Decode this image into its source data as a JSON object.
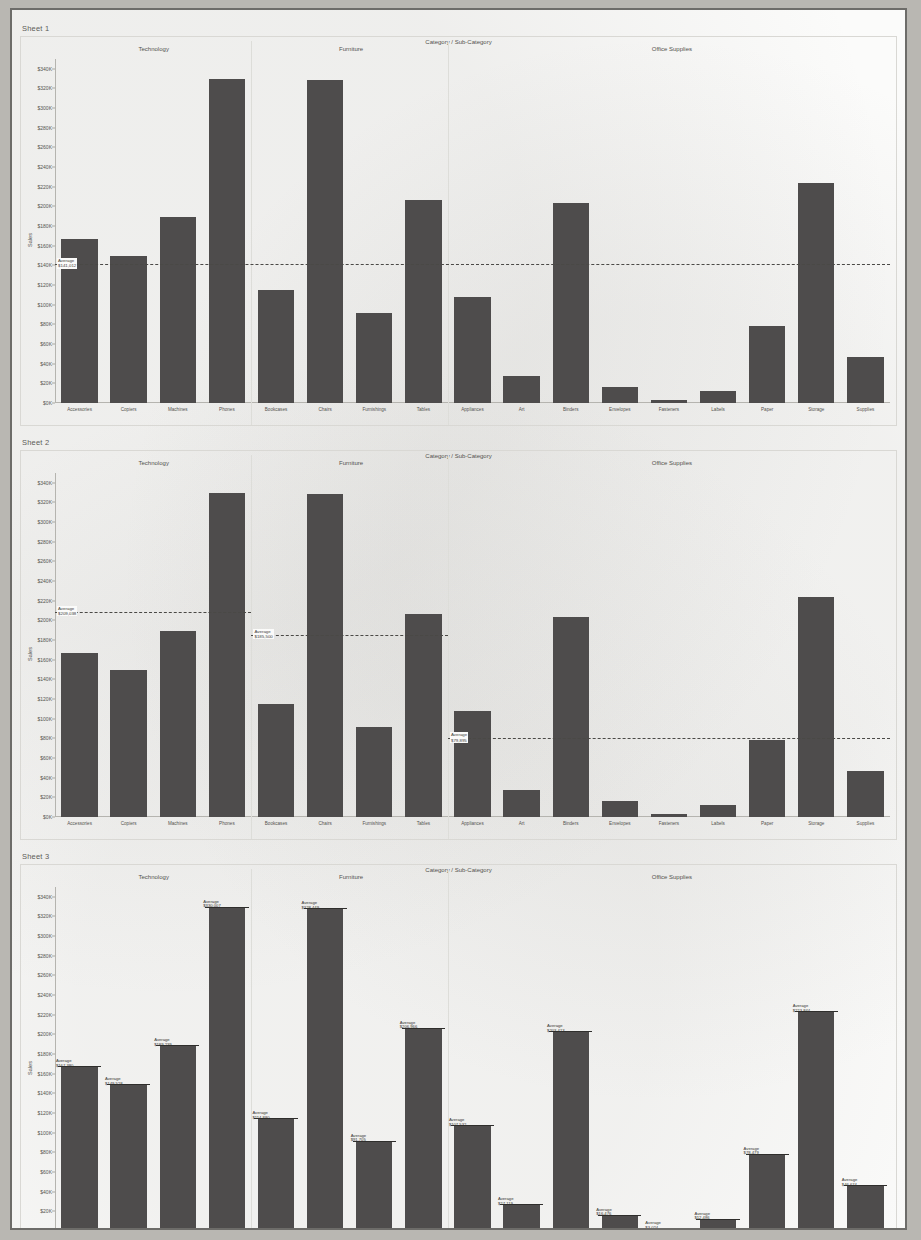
{
  "page": {
    "background_color": "#fbfbfa",
    "border_color": "#6d6c69",
    "bar_color": "#4e4c4c"
  },
  "column_title": "Category / Sub-Category",
  "yaxis_title": "Sales",
  "panes": [
    {
      "label": "Technology"
    },
    {
      "label": "Furniture"
    },
    {
      "label": "Office Supplies"
    }
  ],
  "categories": [
    "Accessories",
    "Copiers",
    "Machines",
    "Phones",
    "Bookcases",
    "Chairs",
    "Furnishings",
    "Tables",
    "Appliances",
    "Art",
    "Binders",
    "Envelopes",
    "Fasteners",
    "Labels",
    "Paper",
    "Storage",
    "Supplies"
  ],
  "pane_spans": [
    4,
    4,
    9
  ],
  "sheets": [
    {
      "title": "Sheet 1",
      "chart_data": {
        "type": "bar",
        "title": "Sheet 1",
        "xlabel": "Category / Sub-Category",
        "ylabel": "Sales",
        "ylim": [
          0,
          350000
        ],
        "grid": false,
        "legend": "none",
        "yticks": [
          "$0K",
          "$20K",
          "$40K",
          "$60K",
          "$80K",
          "$100K",
          "$120K",
          "$140K",
          "$160K",
          "$180K",
          "$200K",
          "$220K",
          "$240K",
          "$260K",
          "$280K",
          "$300K",
          "$320K",
          "$340K"
        ],
        "ytick_values": [
          0,
          20000,
          40000,
          60000,
          80000,
          100000,
          120000,
          140000,
          160000,
          180000,
          200000,
          220000,
          240000,
          260000,
          280000,
          300000,
          320000,
          340000
        ],
        "categories": [
          "Accessories",
          "Copiers",
          "Machines",
          "Phones",
          "Bookcases",
          "Chairs",
          "Furnishings",
          "Tables",
          "Appliances",
          "Art",
          "Binders",
          "Envelopes",
          "Fasteners",
          "Labels",
          "Paper",
          "Storage",
          "Supplies"
        ],
        "values": [
          167380,
          149528,
          189239,
          330007,
          114880,
          328449,
          91705,
          206966,
          107532,
          27119,
          203413,
          16476,
          3024,
          12486,
          78479,
          223844,
          46674
        ],
        "reference_lines": [
          {
            "scope": "table",
            "label": "Average",
            "value_label": "$141,012",
            "value": 141012,
            "from_index": 0,
            "to_index": 16
          }
        ]
      }
    },
    {
      "title": "Sheet 2",
      "chart_data": {
        "type": "bar",
        "title": "Sheet 2",
        "xlabel": "Category / Sub-Category",
        "ylabel": "Sales",
        "ylim": [
          0,
          350000
        ],
        "grid": false,
        "legend": "none",
        "yticks": [
          "$0K",
          "$20K",
          "$40K",
          "$60K",
          "$80K",
          "$100K",
          "$120K",
          "$140K",
          "$160K",
          "$180K",
          "$200K",
          "$220K",
          "$240K",
          "$260K",
          "$280K",
          "$300K",
          "$320K",
          "$340K"
        ],
        "ytick_values": [
          0,
          20000,
          40000,
          60000,
          80000,
          100000,
          120000,
          140000,
          160000,
          180000,
          200000,
          220000,
          240000,
          260000,
          280000,
          300000,
          320000,
          340000
        ],
        "categories": [
          "Accessories",
          "Copiers",
          "Machines",
          "Phones",
          "Bookcases",
          "Chairs",
          "Furnishings",
          "Tables",
          "Appliances",
          "Art",
          "Binders",
          "Envelopes",
          "Fasteners",
          "Labels",
          "Paper",
          "Storage",
          "Supplies"
        ],
        "values": [
          167380,
          149528,
          189239,
          330007,
          114880,
          328449,
          91705,
          206966,
          107532,
          27119,
          203413,
          16476,
          3024,
          12486,
          78479,
          223844,
          46674
        ],
        "reference_lines": [
          {
            "scope": "pane",
            "label": "Average",
            "value_label": "$209,038",
            "value": 209038,
            "from_index": 0,
            "to_index": 3
          },
          {
            "scope": "pane",
            "label": "Average",
            "value_label": "$185,500",
            "value": 185500,
            "from_index": 4,
            "to_index": 7
          },
          {
            "scope": "pane",
            "label": "Average",
            "value_label": "$79,895",
            "value": 79895,
            "from_index": 8,
            "to_index": 16
          }
        ]
      }
    },
    {
      "title": "Sheet 3",
      "chart_data": {
        "type": "bar",
        "title": "Sheet 3",
        "xlabel": "Category / Sub-Category",
        "ylabel": "Sales",
        "ylim": [
          0,
          350000
        ],
        "grid": false,
        "legend": "none",
        "yticks": [
          "$0K",
          "$20K",
          "$40K",
          "$60K",
          "$80K",
          "$100K",
          "$120K",
          "$140K",
          "$160K",
          "$180K",
          "$200K",
          "$220K",
          "$240K",
          "$260K",
          "$280K",
          "$300K",
          "$320K",
          "$340K"
        ],
        "ytick_values": [
          0,
          20000,
          40000,
          60000,
          80000,
          100000,
          120000,
          140000,
          160000,
          180000,
          200000,
          220000,
          240000,
          260000,
          280000,
          300000,
          320000,
          340000
        ],
        "categories": [
          "Accessories",
          "Copiers",
          "Machines",
          "Phones",
          "Bookcases",
          "Chairs",
          "Furnishings",
          "Tables",
          "Appliances",
          "Art",
          "Binders",
          "Envelopes",
          "Fasteners",
          "Labels",
          "Paper",
          "Storage",
          "Supplies"
        ],
        "values": [
          167380,
          149528,
          189239,
          330007,
          114880,
          328449,
          91705,
          206966,
          107532,
          27119,
          203413,
          16476,
          3024,
          12486,
          78479,
          223844,
          46674
        ],
        "reference_lines": [
          {
            "scope": "cell",
            "label": "Average",
            "value_label": "$167,380",
            "value": 167380,
            "index": 0
          },
          {
            "scope": "cell",
            "label": "Average",
            "value_label": "$149,528",
            "value": 149528,
            "index": 1
          },
          {
            "scope": "cell",
            "label": "Average",
            "value_label": "$189,239",
            "value": 189239,
            "index": 2
          },
          {
            "scope": "cell",
            "label": "Average",
            "value_label": "$330,007",
            "value": 330007,
            "index": 3
          },
          {
            "scope": "cell",
            "label": "Average",
            "value_label": "$114,880",
            "value": 114880,
            "index": 4
          },
          {
            "scope": "cell",
            "label": "Average",
            "value_label": "$328,449",
            "value": 328449,
            "index": 5
          },
          {
            "scope": "cell",
            "label": "Average",
            "value_label": "$91,705",
            "value": 91705,
            "index": 6
          },
          {
            "scope": "cell",
            "label": "Average",
            "value_label": "$206,966",
            "value": 206966,
            "index": 7
          },
          {
            "scope": "cell",
            "label": "Average",
            "value_label": "$107,532",
            "value": 107532,
            "index": 8
          },
          {
            "scope": "cell",
            "label": "Average",
            "value_label": "$27,119",
            "value": 27119,
            "index": 9
          },
          {
            "scope": "cell",
            "label": "Average",
            "value_label": "$203,413",
            "value": 203413,
            "index": 10
          },
          {
            "scope": "cell",
            "label": "Average",
            "value_label": "$16,476",
            "value": 16476,
            "index": 11
          },
          {
            "scope": "cell",
            "label": "Average",
            "value_label": "$3,024",
            "value": 3024,
            "index": 12
          },
          {
            "scope": "cell",
            "label": "Average",
            "value_label": "$12,486",
            "value": 12486,
            "index": 13
          },
          {
            "scope": "cell",
            "label": "Average",
            "value_label": "$78,479",
            "value": 78479,
            "index": 14
          },
          {
            "scope": "cell",
            "label": "Average",
            "value_label": "$223,844",
            "value": 223844,
            "index": 15
          },
          {
            "scope": "cell",
            "label": "Average",
            "value_label": "$46,674",
            "value": 46674,
            "index": 16
          }
        ]
      }
    }
  ]
}
